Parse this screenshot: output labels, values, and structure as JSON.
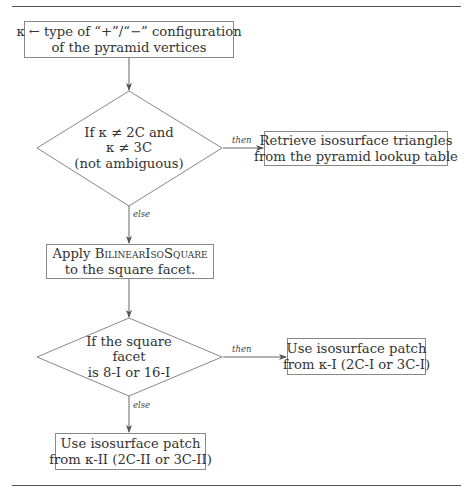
{
  "diagram": {
    "type": "flowchart",
    "nodes": {
      "start": {
        "kind": "process",
        "lines": [
          "κ ← type of “+”/“−” configuration",
          "of the pyramid vertices"
        ]
      },
      "decision1": {
        "kind": "decision",
        "lines": [
          "If κ ≠ 2C and",
          "κ ≠ 3C",
          "(not ambiguous)"
        ]
      },
      "retrieve": {
        "kind": "process",
        "lines": [
          "Retrieve isosurface triangles",
          "from the pyramid lookup table"
        ]
      },
      "apply": {
        "kind": "process",
        "line1_prefix": "Apply ",
        "line1_smallcaps": "BilinearIsoSquare",
        "line2": "to the square facet."
      },
      "decision2": {
        "kind": "decision",
        "lines": [
          "If the square",
          "facet",
          "is 8-I or 16-I"
        ]
      },
      "patch1": {
        "kind": "process",
        "lines": [
          "Use isosurface patch",
          "from κ-I (2C-I or 3C-I)"
        ]
      },
      "patch2": {
        "kind": "process",
        "lines": [
          "Use isosurface patch",
          "from κ-II (2C-II or 3C-II)"
        ]
      }
    },
    "edges": [
      {
        "from": "start",
        "to": "decision1",
        "label": ""
      },
      {
        "from": "decision1",
        "to": "retrieve",
        "label": "then"
      },
      {
        "from": "decision1",
        "to": "apply",
        "label": "else"
      },
      {
        "from": "apply",
        "to": "decision2",
        "label": ""
      },
      {
        "from": "decision2",
        "to": "patch1",
        "label": "then"
      },
      {
        "from": "decision2",
        "to": "patch2",
        "label": "else"
      }
    ],
    "edge_labels": {
      "d1_then": "then",
      "d1_else": "else",
      "d2_then": "then",
      "d2_else": "else"
    },
    "colors": {
      "stroke": "#888888",
      "arrow": "#555555",
      "text": "#333333",
      "rule": "#555555"
    }
  }
}
